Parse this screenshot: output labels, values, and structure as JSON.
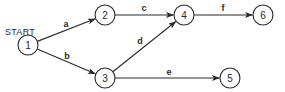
{
  "diagram": {
    "start_label": "START",
    "start_label_pos": {
      "x": 20,
      "y": 35
    },
    "colors": {
      "stroke": "#2a2a2a",
      "background": "#ffffff"
    },
    "node_radius": 10,
    "nodes": [
      {
        "id": "1",
        "label": "1",
        "x": 28,
        "y": 45
      },
      {
        "id": "2",
        "label": "2",
        "x": 105,
        "y": 15
      },
      {
        "id": "3",
        "label": "3",
        "x": 105,
        "y": 78
      },
      {
        "id": "4",
        "label": "4",
        "x": 184,
        "y": 15
      },
      {
        "id": "5",
        "label": "5",
        "x": 230,
        "y": 78
      },
      {
        "id": "6",
        "label": "6",
        "x": 263,
        "y": 15
      }
    ],
    "edges": [
      {
        "id": "a",
        "label": "a",
        "from": "1",
        "to": "2",
        "label_x": 66,
        "label_y": 27
      },
      {
        "id": "b",
        "label": "b",
        "from": "1",
        "to": "3",
        "label_x": 67,
        "label_y": 59
      },
      {
        "id": "c",
        "label": "c",
        "from": "2",
        "to": "4",
        "label_x": 144,
        "label_y": 11
      },
      {
        "id": "d",
        "label": "d",
        "from": "3",
        "to": "4",
        "label_x": 140,
        "label_y": 44
      },
      {
        "id": "e",
        "label": "e",
        "from": "3",
        "to": "5",
        "label_x": 169,
        "label_y": 75
      },
      {
        "id": "f",
        "label": "f",
        "from": "4",
        "to": "6",
        "label_x": 223,
        "label_y": 11
      }
    ]
  }
}
